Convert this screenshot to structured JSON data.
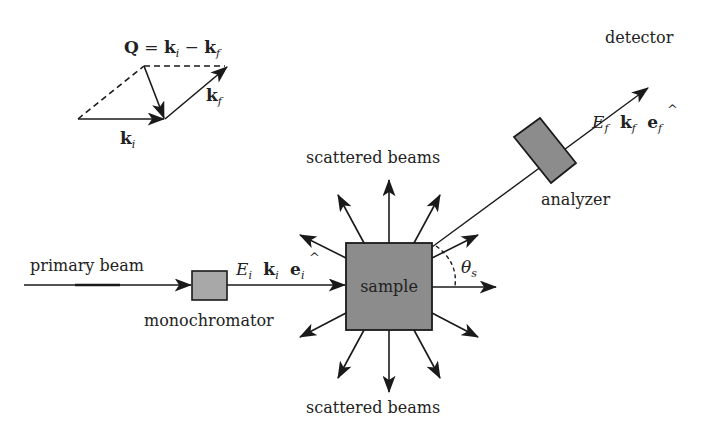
{
  "diagram": {
    "colors": {
      "line": "#1a1a1a",
      "box_fill": "#8c8c8c",
      "small_box_fill": "#a8a8a8",
      "text": "#222222"
    },
    "labels": {
      "primary_beam": "primary beam",
      "monochromator": "monochromator",
      "sample": "sample",
      "scattered_top": "scattered beams",
      "scattered_bottom": "scattered beams",
      "analyzer": "analyzer",
      "detector": "detector",
      "theta": "θ",
      "theta_sub": "s"
    },
    "incident": {
      "E": "E",
      "E_sub": "i",
      "k": "k",
      "k_sub": "i",
      "e": "e",
      "e_sub": "i",
      "hat": "^"
    },
    "final": {
      "E": "E",
      "E_sub": "f",
      "k": "k",
      "k_sub": "f",
      "e": "e",
      "e_sub": "f",
      "hat": "^"
    },
    "vector_diagram": {
      "equation_Q": "Q",
      "equation_eq": " = ",
      "equation_k1": "k",
      "equation_k1_sub": "i",
      "equation_minus": " − ",
      "equation_k2": "k",
      "equation_k2_sub": "f",
      "ki_label": "k",
      "ki_sub": "i",
      "kf_label": "k",
      "kf_sub": "f"
    }
  }
}
